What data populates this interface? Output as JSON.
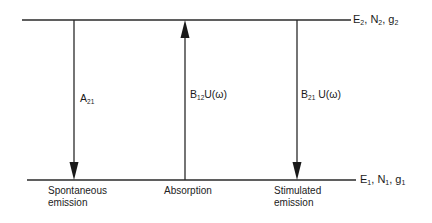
{
  "diagram": {
    "type": "energy-level transitions",
    "levels": {
      "upper": {
        "energy": "E",
        "energy_sub": "2",
        "population": "N",
        "population_sub": "2",
        "degeneracy": "g",
        "degeneracy_sub": "2"
      },
      "lower": {
        "energy": "E",
        "energy_sub": "1",
        "population": "N",
        "population_sub": "1",
        "degeneracy": "g",
        "degeneracy_sub": "1"
      }
    },
    "transitions": [
      {
        "id": "spontaneous",
        "direction": "down",
        "coef": "A",
        "coef_sub": "21",
        "suffix": "",
        "caption_line1": "Spontaneous",
        "caption_line2": "emission"
      },
      {
        "id": "absorption",
        "direction": "up",
        "coef": "B",
        "coef_sub": "12",
        "suffix": "U(ω)",
        "caption_line1": "Absorption",
        "caption_line2": ""
      },
      {
        "id": "stimulated",
        "direction": "down",
        "coef": "B",
        "coef_sub": "21",
        "suffix": "U(ω)",
        "caption_line1": "Stimulated",
        "caption_line2": "emission"
      }
    ],
    "colors": {
      "line": "#2a2a2a",
      "background": "#ffffff"
    }
  }
}
